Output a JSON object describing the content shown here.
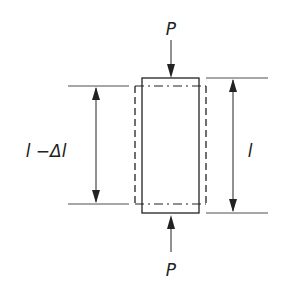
{
  "diagram": {
    "type": "compression-specimen",
    "labels": {
      "load_top": "P",
      "load_bottom": "P",
      "original_length": "l",
      "compressed_length": "l −Δl"
    },
    "colors": {
      "line": "#222222",
      "background": "#ffffff"
    }
  }
}
